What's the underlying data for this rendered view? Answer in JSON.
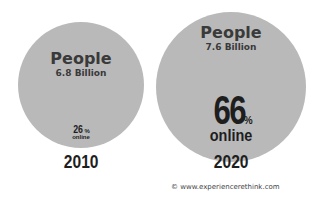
{
  "chart_data": {
    "type": "bubble",
    "title": "",
    "series": [
      {
        "year": "2010",
        "people_label": "People",
        "population": "6.8 Billion",
        "online_pct": 26,
        "online_pct_label": "26%",
        "online_label": "online"
      },
      {
        "year": "2020",
        "people_label": "People",
        "population": "7.6 Billion",
        "online_pct": 66,
        "online_pct_label": "66%",
        "online_label": "online"
      }
    ],
    "colors": {
      "circle": "#b9b9b9",
      "text": "#1e1e1e"
    }
  },
  "circles": [
    {
      "people": "People",
      "population": "6.8 Billion",
      "pct_num": "26",
      "pct_sym": "%",
      "online": "online",
      "year": "2010"
    },
    {
      "people": "People",
      "population": "7.6 Billion",
      "pct_num": "66",
      "pct_sym": "%",
      "online": "online",
      "year": "2020"
    }
  ],
  "footer": {
    "copyright": "© www.experiencerethink.com"
  }
}
